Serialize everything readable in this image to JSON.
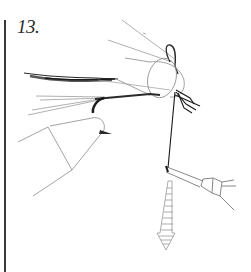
{
  "figure": {
    "step_label": "13.",
    "colors": {
      "ink": "#2a2a2a",
      "light_line": "#9a9a9a",
      "background": "#ffffff"
    }
  }
}
